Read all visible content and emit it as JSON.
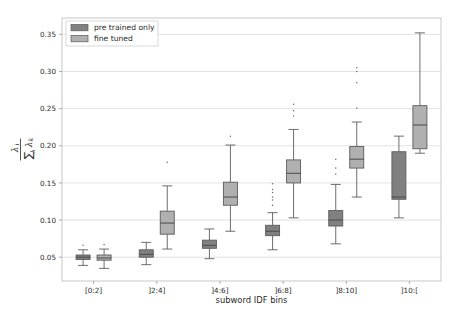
{
  "chart_data": {
    "type": "box",
    "title": "",
    "xlabel": "subword IDF bins",
    "ylabel": "lambda_i / sum_k lambda_k",
    "ylabel_parts": {
      "numerator_sym": "λ",
      "numerator_sub": "i",
      "sum_sym": "∑",
      "sum_sub": "k",
      "denominator_sym": "λ",
      "denominator_sub": "k"
    },
    "categories": [
      "[0:2]",
      "]2:4]",
      "]4:6]",
      "]6:8]",
      "]8:10]",
      "]10:["
    ],
    "yticks": [
      0.05,
      0.1,
      0.15,
      0.2,
      0.25,
      0.3,
      0.35
    ],
    "ytick_labels": [
      "0.05",
      "0.10",
      "0.15",
      "0.20",
      "0.25",
      "0.30",
      "0.35"
    ],
    "ylim": [
      0.018,
      0.372
    ],
    "grid": true,
    "grid_axis": "y",
    "legend": {
      "position": "upper left",
      "entries": [
        {
          "label": "pre trained only",
          "color": "#808080"
        },
        {
          "label": "fine tuned",
          "color": "#b0b0b0"
        }
      ]
    },
    "series": [
      {
        "name": "pre trained only",
        "color": "#808080",
        "boxes": [
          {
            "category": "[0:2]",
            "whisker_low": 0.039,
            "q1": 0.047,
            "median": 0.05,
            "q3": 0.053,
            "whisker_high": 0.06,
            "outliers": [
              0.066
            ]
          },
          {
            "category": "]2:4]",
            "whisker_low": 0.04,
            "q1": 0.05,
            "median": 0.054,
            "q3": 0.06,
            "whisker_high": 0.07,
            "outliers": []
          },
          {
            "category": "]4:6]",
            "whisker_low": 0.048,
            "q1": 0.062,
            "median": 0.066,
            "q3": 0.073,
            "whisker_high": 0.088,
            "outliers": []
          },
          {
            "category": "]6:8]",
            "whisker_low": 0.06,
            "q1": 0.079,
            "median": 0.085,
            "q3": 0.093,
            "whisker_high": 0.11,
            "outliers": [
              0.12,
              0.127,
              0.131,
              0.137,
              0.141,
              0.149
            ]
          },
          {
            "category": "]8:10]",
            "whisker_low": 0.068,
            "q1": 0.092,
            "median": 0.1,
            "q3": 0.113,
            "whisker_high": 0.148,
            "outliers": [
              0.162,
              0.17,
              0.182
            ]
          },
          {
            "category": "]10:[",
            "whisker_low": 0.103,
            "q1": 0.128,
            "median": 0.131,
            "q3": 0.192,
            "whisker_high": 0.213,
            "outliers": []
          }
        ]
      },
      {
        "name": "fine tuned",
        "color": "#b0b0b0",
        "boxes": [
          {
            "category": "[0:2]",
            "whisker_low": 0.035,
            "q1": 0.046,
            "median": 0.049,
            "q3": 0.053,
            "whisker_high": 0.061,
            "outliers": [
              0.067
            ]
          },
          {
            "category": "]2:4]",
            "whisker_low": 0.061,
            "q1": 0.081,
            "median": 0.096,
            "q3": 0.112,
            "whisker_high": 0.146,
            "outliers": [
              0.178
            ]
          },
          {
            "category": "]4:6]",
            "whisker_low": 0.085,
            "q1": 0.12,
            "median": 0.131,
            "q3": 0.151,
            "whisker_high": 0.201,
            "outliers": [
              0.213
            ]
          },
          {
            "category": "]6:8]",
            "whisker_low": 0.103,
            "q1": 0.15,
            "median": 0.163,
            "q3": 0.181,
            "whisker_high": 0.222,
            "outliers": [
              0.24,
              0.247,
              0.256
            ]
          },
          {
            "category": "]8:10]",
            "whisker_low": 0.131,
            "q1": 0.17,
            "median": 0.182,
            "q3": 0.199,
            "whisker_high": 0.232,
            "outliers": [
              0.251,
              0.285,
              0.3,
              0.305
            ]
          },
          {
            "category": "]10:[",
            "whisker_low": 0.19,
            "q1": 0.196,
            "median": 0.228,
            "q3": 0.254,
            "whisker_high": 0.352,
            "outliers": []
          }
        ]
      }
    ]
  },
  "axes": {
    "plot_left": 62,
    "plot_right": 441,
    "plot_top": 18,
    "plot_bottom": 281
  }
}
